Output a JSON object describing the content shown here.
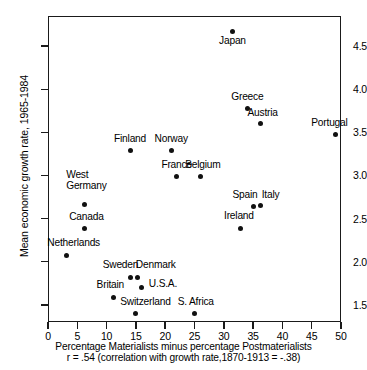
{
  "chart_data": {
    "type": "scatter",
    "title": "",
    "xlabel": "Percentage Materialists minus percentage  Postmaterialists",
    "ylabel": "Mean economic growth rate, 1965-1984",
    "annotation": "r =  .54 (correlation with growth rate,1870-1913 = -.38)",
    "xlim": [
      0,
      50
    ],
    "ylim": [
      1.3,
      4.85
    ],
    "xticks": [
      0,
      5,
      10,
      15,
      20,
      25,
      30,
      35,
      40,
      45,
      50
    ],
    "yticks": [
      1.5,
      2.0,
      2.5,
      3.0,
      3.5,
      4.0,
      4.5
    ],
    "xtick_labels": [
      "0",
      "5",
      "10",
      "15",
      "20",
      "25",
      "30",
      "35",
      "40",
      "45",
      "50"
    ],
    "ytick_labels": [
      "1.5",
      "2.0",
      "2.5",
      "3.0",
      "3.5",
      "4.0",
      "4.5"
    ],
    "grid": false,
    "legend": "none",
    "points": [
      {
        "label": "Japan",
        "x": 31.5,
        "y": 4.67,
        "lx": 31.5,
        "ly": 4.55,
        "anchor": "center"
      },
      {
        "label": "Greece",
        "x": 34.0,
        "y": 3.78,
        "lx": 34.0,
        "ly": 3.9,
        "anchor": "center"
      },
      {
        "label": "Austria",
        "x": 36.3,
        "y": 3.6,
        "lx": 36.6,
        "ly": 3.72,
        "anchor": "center"
      },
      {
        "label": "Portugal",
        "x": 49.0,
        "y": 3.47,
        "lx": 48.0,
        "ly": 3.6,
        "anchor": "center"
      },
      {
        "label": "Finland",
        "x": 14.0,
        "y": 3.29,
        "lx": 14.0,
        "ly": 3.42,
        "anchor": "center"
      },
      {
        "label": "Norway",
        "x": 21.0,
        "y": 3.29,
        "lx": 21.0,
        "ly": 3.42,
        "anchor": "center"
      },
      {
        "label": "France",
        "x": 22.0,
        "y": 2.99,
        "lx": 22.0,
        "ly": 3.12,
        "anchor": "center"
      },
      {
        "label": "Belgium",
        "x": 26.0,
        "y": 2.99,
        "lx": 26.4,
        "ly": 3.12,
        "anchor": "center"
      },
      {
        "label": "West\nGermany",
        "x": 6.2,
        "y": 2.66,
        "lx": 6.6,
        "ly": 2.94,
        "anchor": "center"
      },
      {
        "label": "Spain",
        "x": 35.1,
        "y": 2.64,
        "lx": 33.6,
        "ly": 2.77,
        "anchor": "center"
      },
      {
        "label": "Italy",
        "x": 36.3,
        "y": 2.65,
        "lx": 38.0,
        "ly": 2.77,
        "anchor": "center"
      },
      {
        "label": "Canada",
        "x": 6.2,
        "y": 2.38,
        "lx": 6.6,
        "ly": 2.51,
        "anchor": "center"
      },
      {
        "label": "Ireland",
        "x": 32.9,
        "y": 2.38,
        "lx": 32.6,
        "ly": 2.52,
        "anchor": "center"
      },
      {
        "label": "Netherlands",
        "x": 3.1,
        "y": 2.07,
        "lx": 4.4,
        "ly": 2.21,
        "anchor": "center"
      },
      {
        "label": "Sweden",
        "x": 14.1,
        "y": 1.82,
        "lx": 12.4,
        "ly": 1.96,
        "anchor": "center"
      },
      {
        "label": "Denmark",
        "x": 15.2,
        "y": 1.82,
        "lx": 18.4,
        "ly": 1.96,
        "anchor": "center"
      },
      {
        "label": "U.S.A.",
        "x": 16.0,
        "y": 1.7,
        "lx": 19.6,
        "ly": 1.74,
        "anchor": "center"
      },
      {
        "label": "Britain",
        "x": 11.2,
        "y": 1.58,
        "lx": 10.6,
        "ly": 1.72,
        "anchor": "center"
      },
      {
        "label": "Switzerland",
        "x": 15.0,
        "y": 1.4,
        "lx": 16.6,
        "ly": 1.53,
        "anchor": "center"
      },
      {
        "label": "S. Africa",
        "x": 25.0,
        "y": 1.4,
        "lx": 25.2,
        "ly": 1.53,
        "anchor": "center"
      }
    ]
  }
}
